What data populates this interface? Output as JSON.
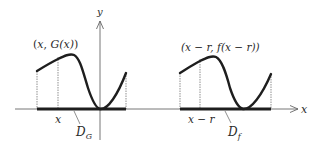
{
  "figure": {
    "axes": {
      "x_label": "x",
      "y_label": "y"
    },
    "left_panel": {
      "point_label_open": "(",
      "point_label_x": "x",
      "point_label_sep": ", ",
      "point_label_fn": "G",
      "point_label_arg": "(x)",
      "point_label_close": ")",
      "point_label_full": "(x, G(x))",
      "tick_label": "x",
      "domain_label_main": "D",
      "domain_label_sub": "G",
      "domain_label_full": "D_G"
    },
    "right_panel": {
      "point_label_full": "(x − r, f(x − r))",
      "tick_label": "x − r",
      "domain_label_main": "D",
      "domain_label_sub": "f",
      "domain_label_full": "D_f"
    },
    "colors": {
      "ink": "#2a2a2a",
      "curve": "#1e1e1e",
      "axis": "#555555",
      "background": "#ffffff"
    }
  }
}
